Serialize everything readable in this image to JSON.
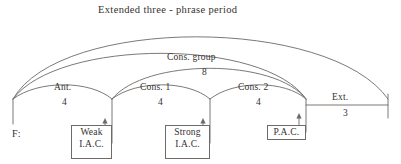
{
  "figure": {
    "title": "Extended three - phrase period",
    "baseline_label": "F:",
    "colors": {
      "background": "#ffffff",
      "stroke": "#6d6a68",
      "text": "#34312f"
    }
  },
  "arcs": [
    {
      "id": "extended-period",
      "label": "Extended three - phrase period",
      "count": ""
    },
    {
      "id": "unlabeled-middle-arc",
      "label": "",
      "count": ""
    },
    {
      "id": "cons-group",
      "label": "Cons. group",
      "count": "8"
    },
    {
      "id": "antecedent",
      "label": "Ant.",
      "count": "4"
    },
    {
      "id": "consequent-1",
      "label": "Cons. 1",
      "count": "4"
    },
    {
      "id": "consequent-2",
      "label": "Cons. 2",
      "count": "4"
    },
    {
      "id": "extension",
      "label": "Ext.",
      "count": "3"
    }
  ],
  "cadence_boxes": [
    {
      "id": "weak-iac",
      "line1": "Weak",
      "line2": "I.A.C."
    },
    {
      "id": "strong-iac",
      "line1": "Strong",
      "line2": "I.A.C."
    },
    {
      "id": "pac",
      "line1": "P.A.C.",
      "line2": ""
    }
  ]
}
